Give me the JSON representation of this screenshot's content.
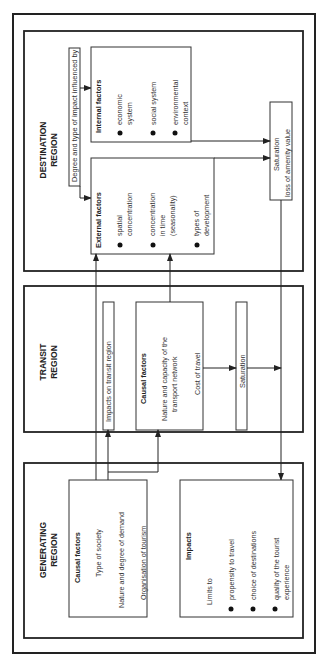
{
  "diagram": {
    "orientation": "rotated-90-ccw",
    "regions": {
      "destination": {
        "title_line1": "DESTINATION",
        "title_line2": "REGION",
        "influence_label": "Degree and type of impact influenced by",
        "internal_factors": {
          "title": "Internal   factors",
          "items": [
            {
              "line1": "economic",
              "line2": "system"
            },
            {
              "line1": "social  system",
              "line2": ""
            },
            {
              "line1": "environmental",
              "line2": "context"
            }
          ]
        },
        "external_factors": {
          "title": "External   factors",
          "items": [
            {
              "line1": "spatial",
              "line2": "concentration",
              "line3": ""
            },
            {
              "line1": "concentration",
              "line2": "in  time",
              "line3": "(seasonality)"
            },
            {
              "line1": "types  of",
              "line2": "development",
              "line3": ""
            }
          ]
        },
        "saturation": {
          "line1": "Saturation",
          "line2": "loss  of  amenity  value"
        }
      },
      "transit": {
        "title_line1": "TRANSIT",
        "title_line2": "REGION",
        "impacts_label": "Impacts  on  transit  region",
        "causal_factors": {
          "title": "Causal   factors",
          "items": [
            "Nature and capacity of the",
            "transport   network",
            "Cost  of  travel"
          ]
        },
        "saturation": "Saturation"
      },
      "generating": {
        "title_line1": "GENERATING",
        "title_line2": "REGION",
        "causal_factors": {
          "title": "Causal   factors",
          "items": [
            "Type  of  society",
            "Nature and degree of demand",
            "Organisation  of  tourism"
          ]
        },
        "impacts": {
          "title": "Impacts",
          "intro": "Limits  to",
          "items": [
            {
              "line1": "propensity  to  travel",
              "line2": ""
            },
            {
              "line1": "choice  of  destinations",
              "line2": ""
            },
            {
              "line1": "quality  of  the  tourist",
              "line2": "experience"
            }
          ]
        }
      }
    }
  }
}
